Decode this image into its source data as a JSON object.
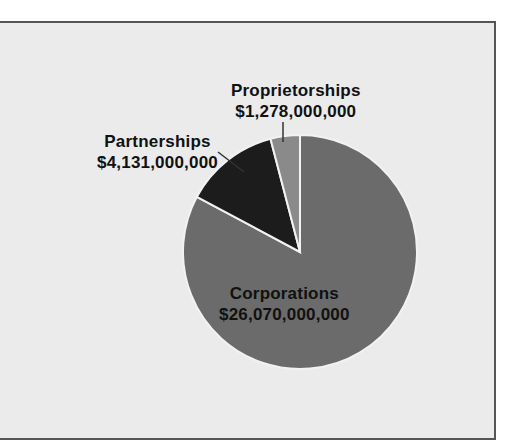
{
  "chart_data": {
    "type": "pie",
    "title": "",
    "series": [
      {
        "name": "Corporations",
        "value": 26070000000,
        "label": "$26,070,000,000",
        "color": "#6b6b6b"
      },
      {
        "name": "Partnerships",
        "value": 4131000000,
        "label": "$4,131,000,000",
        "color": "#1c1c1c"
      },
      {
        "name": "Proprietorships",
        "value": 1278000000,
        "label": "$1,278,000,000",
        "color": "#8a8a8a"
      }
    ],
    "legend": "none (direct labels)"
  },
  "labels": {
    "proprietorships": {
      "name": "Proprietorships",
      "value": "$1,278,000,000"
    },
    "partnerships": {
      "name": "Partnerships",
      "value": "$4,131,000,000"
    },
    "corporations": {
      "name": "Corporations",
      "value": "$26,070,000,000"
    }
  },
  "colors": {
    "background": "#ebebeb",
    "border": "#555555",
    "separator": "#f2f2f2"
  }
}
